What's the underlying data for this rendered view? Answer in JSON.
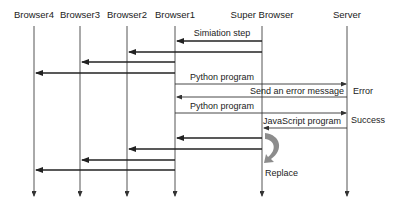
{
  "diagram": {
    "type": "sequence",
    "participants": [
      {
        "id": "browser4",
        "label": "Browser4",
        "x": 34
      },
      {
        "id": "browser3",
        "label": "Browser3",
        "x": 80
      },
      {
        "id": "browser2",
        "label": "Browser2",
        "x": 127
      },
      {
        "id": "browser1",
        "label": "Browser1",
        "x": 175
      },
      {
        "id": "super",
        "label": "Super Browser",
        "x": 262
      },
      {
        "id": "server",
        "label": "Server",
        "x": 347
      }
    ],
    "messages": [
      {
        "label": "Simiation step",
        "from": "super",
        "to": "browser1"
      },
      {
        "label": "",
        "from": "super",
        "to": "browser2"
      },
      {
        "label": "",
        "from": "browser1",
        "to": "browser3"
      },
      {
        "label": "",
        "from": "browser1",
        "to": "browser4"
      },
      {
        "label": "Python program",
        "from": "browser1",
        "to": "server"
      },
      {
        "label": "Send an error message",
        "from": "server",
        "to": "browser1"
      },
      {
        "label": "Python program",
        "from": "browser1",
        "to": "server"
      },
      {
        "label": "JavaScript program",
        "from": "server",
        "to": "super"
      },
      {
        "label": "",
        "from": "super",
        "to": "browser1"
      },
      {
        "label": "",
        "from": "super",
        "to": "browser2"
      },
      {
        "label": "",
        "from": "browser1",
        "to": "browser3"
      },
      {
        "label": "",
        "from": "browser1",
        "to": "browser4"
      }
    ],
    "annotations": {
      "error": "Error",
      "success": "Success",
      "replace": "Replace"
    },
    "colors": {
      "line": "#222222",
      "lifeline": "#555555",
      "replace_arrow": "#8c8c8c"
    }
  }
}
